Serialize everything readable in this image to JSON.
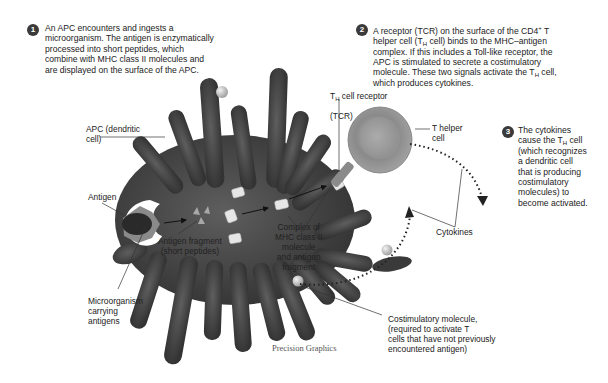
{
  "diagram": {
    "steps": [
      {
        "number": "1",
        "text": "An APC encounters and ingests a\nmicroorganism. The antigen is enzymatically\nprocessed into short peptides, which\ncombine with MHC class II molecules and\nare displayed on the surface of the APC."
      },
      {
        "number": "2",
        "line1": "A receptor (TCR) on the surface of the CD4",
        "line1_sup": "+",
        "line1_end": " T",
        "line2_a": "helper cell (T",
        "line2_sub": "H",
        "line2_b": " cell) binds to the MHC–antigen",
        "line3": "complex. If this includes a Toll-like receptor, the",
        "line4": "APC is stimulated to secrete a costimulatory",
        "line5_a": "molecule. These two signals activate the T",
        "line5_sub": "H",
        "line5_b": " cell,",
        "line6": "which produces cytokines."
      },
      {
        "number": "3",
        "line1": "The cytokines",
        "line2_a": "cause the T",
        "line2_sub": "H",
        "line2_b": " cell",
        "line3": "(which recognizes",
        "line4": "a dendritic cell",
        "line5": "that is producing",
        "line6": "costimulatory",
        "line7": "molecules) to",
        "line8": "become activated."
      }
    ],
    "labels": {
      "apc": "APC (dendritic\ncell)",
      "antigen": "Antigen",
      "antigen_fragment": "Antigen fragment\n(short peptides)",
      "microorganism": "Microorganism\ncarrying\nantigens",
      "complex": "Complex of\nMHC class II\nmolecule\nand antigen\nfragment",
      "tcr_a": "T",
      "tcr_sub": "H",
      "tcr_b": " cell receptor",
      "tcr_c": "(TCR)",
      "t_helper": "T helper\ncell",
      "cytokines": "Cytokines",
      "costimulatory": "Costimulatory molecule,\n(required to activate T\ncells that have not previously\nencountered antigen)"
    },
    "credit": "Precision Graphics",
    "colors": {
      "apc_body": "#4a4a4a",
      "apc_dark": "#2e2e2e",
      "t_cell": "#8a8a8a",
      "badge": "#3a3a3a",
      "mhc": "#e6e6e6",
      "costim_ball": "#c8c8c8"
    }
  }
}
